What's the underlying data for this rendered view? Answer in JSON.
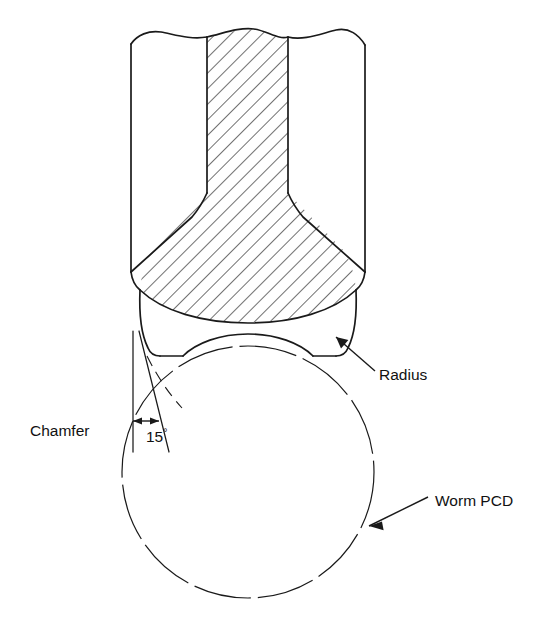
{
  "figure": {
    "kind": "engineering-cross-section",
    "background_color": "#ffffff",
    "line_color": "#1a1a1a",
    "hatch_color": "#1a1a1a",
    "labels": {
      "chamfer": "Chamfer",
      "angle": "15",
      "angle_unit": "°",
      "radius": "Radius",
      "worm_pcd": "Worm PCD"
    },
    "annotations": [
      {
        "name": "chamfer",
        "text": "Chamfer",
        "x": 30,
        "y": 432,
        "leader": "none",
        "interactable": false
      },
      {
        "name": "angle-dimension",
        "text": "15°",
        "x": 146,
        "y": 437,
        "leader": "double-arrow-horizontal",
        "interactable": false
      },
      {
        "name": "radius",
        "text": "Radius",
        "x": 379,
        "y": 375,
        "leader": "arrow-to-fillet",
        "interactable": false
      },
      {
        "name": "worm-pcd",
        "text": "Worm PCD",
        "x": 435,
        "y": 501,
        "leader": "arrow-to-circle",
        "interactable": false
      }
    ],
    "geometry": {
      "worm_pcd_circle": {
        "center_x": 248,
        "center_y": 472,
        "radius": 126,
        "style": "long-dash"
      },
      "body_left_edge_x": 131,
      "body_right_edge_x": 365,
      "hatch_left_wall_x": 207,
      "hatch_right_wall_x": 288,
      "break_line_top_y": 33,
      "flare_start_y": 193,
      "flare_end_y": 272,
      "chamfer_angle_degrees": 15
    }
  }
}
